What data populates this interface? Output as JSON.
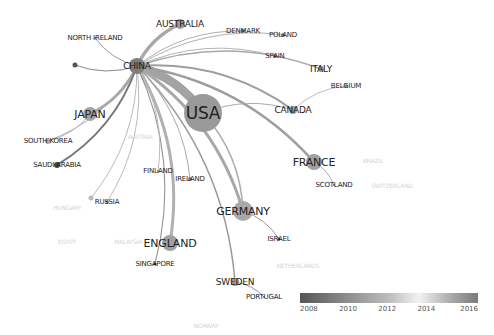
{
  "diagram": {
    "type": "country-collaboration-network",
    "nodes": [
      {
        "id": "usa",
        "label": "USA",
        "x": 203,
        "y": 113,
        "r": 19,
        "size": "xl",
        "shade": "#9a9a9a"
      },
      {
        "id": "china",
        "label": "CHINA",
        "x": 137,
        "y": 66,
        "r": 8,
        "size": "m",
        "shade": "#7d7d7d"
      },
      {
        "id": "australia",
        "label": "AUSTRALIA",
        "x": 180,
        "y": 24,
        "r": 5,
        "size": "m",
        "shade": "#9a9a9a"
      },
      {
        "id": "japan",
        "label": "JAPAN",
        "x": 90,
        "y": 114,
        "r": 7,
        "size": "l",
        "shade": "#a5a5a5"
      },
      {
        "id": "germany",
        "label": "GERMANY",
        "x": 243,
        "y": 211,
        "r": 10,
        "size": "l",
        "shade": "#a8a8a8"
      },
      {
        "id": "england",
        "label": "ENGLAND",
        "x": 170,
        "y": 243,
        "r": 8,
        "size": "l",
        "shade": "#a0a0a0"
      },
      {
        "id": "france",
        "label": "FRANCE",
        "x": 314,
        "y": 162,
        "r": 8,
        "size": "l",
        "shade": "#a0a0a0"
      },
      {
        "id": "canada",
        "label": "CANADA",
        "x": 293,
        "y": 110,
        "r": 4,
        "size": "m",
        "shade": "#9a9a9a"
      },
      {
        "id": "italy",
        "label": "ITALY",
        "x": 321,
        "y": 69,
        "r": 3,
        "size": "m",
        "shade": "#9a9a9a"
      },
      {
        "id": "spain",
        "label": "SPAIN",
        "x": 275,
        "y": 56,
        "r": 2,
        "size": "s",
        "shade": "#777"
      },
      {
        "id": "denmark",
        "label": "DENMARK",
        "x": 243,
        "y": 31,
        "r": 2,
        "size": "s",
        "shade": "#777"
      },
      {
        "id": "poland",
        "label": "POLAND",
        "x": 283,
        "y": 35,
        "r": 2,
        "size": "s",
        "shade": "#777"
      },
      {
        "id": "belgium",
        "label": "BELGIUM",
        "x": 346,
        "y": 86,
        "r": 2,
        "size": "s",
        "shade": "#999"
      },
      {
        "id": "north-ireland",
        "label": "NORTH IRELAND",
        "x": 95,
        "y": 38,
        "r": 1,
        "size": "s",
        "shade": "#777"
      },
      {
        "id": "unlabeled",
        "label": "",
        "x": 75,
        "y": 65,
        "r": 2.5,
        "size": "s",
        "shade": "#555"
      },
      {
        "id": "south-korea",
        "label": "SOUTH KOREA",
        "x": 48,
        "y": 141,
        "r": 3,
        "size": "s",
        "shade": "#aaa"
      },
      {
        "id": "saudi-arabia",
        "label": "SAUDI ARABIA",
        "x": 57,
        "y": 165,
        "r": 3,
        "size": "s",
        "shade": "#444"
      },
      {
        "id": "finland",
        "label": "FINLAND",
        "x": 158,
        "y": 171,
        "r": 1,
        "size": "s",
        "shade": "#777"
      },
      {
        "id": "ireland",
        "label": "IRELAND",
        "x": 190,
        "y": 179,
        "r": 2,
        "size": "s",
        "shade": "#777"
      },
      {
        "id": "russia",
        "label": "RUSSIA",
        "x": 107,
        "y": 202,
        "r": 2,
        "size": "s",
        "shade": "#999"
      },
      {
        "id": "russia-dot",
        "label": "",
        "x": 91,
        "y": 198,
        "r": 2.5,
        "size": "s",
        "shade": "#bbb"
      },
      {
        "id": "singapore",
        "label": "SINGAPORE",
        "x": 155,
        "y": 264,
        "r": 1.5,
        "size": "s",
        "shade": "#333"
      },
      {
        "id": "sweden",
        "label": "SWEDEN",
        "x": 235,
        "y": 282,
        "r": 4,
        "size": "m",
        "shade": "#999"
      },
      {
        "id": "portugal",
        "label": "PORTUGAL",
        "x": 264,
        "y": 297,
        "r": 1,
        "size": "s",
        "shade": "#777"
      },
      {
        "id": "scotland",
        "label": "SCOTLAND",
        "x": 334,
        "y": 185,
        "r": 1,
        "size": "s",
        "shade": "#777"
      },
      {
        "id": "israel",
        "label": "ISRAEL",
        "x": 279,
        "y": 239,
        "r": 1.5,
        "size": "s",
        "shade": "#333"
      },
      {
        "id": "brazil",
        "label": "BRAZIL",
        "x": 373,
        "y": 160,
        "r": 0,
        "size": "faint",
        "shade": "#ddd"
      },
      {
        "id": "switzerland",
        "label": "SWITZERLAND",
        "x": 392,
        "y": 185,
        "r": 0,
        "size": "faint",
        "shade": "#ddd"
      },
      {
        "id": "netherlands",
        "label": "NETHERLANDS",
        "x": 298,
        "y": 265,
        "r": 0,
        "size": "faint",
        "shade": "#ddd"
      },
      {
        "id": "hungary",
        "label": "HUNGARY",
        "x": 67,
        "y": 207,
        "r": 0,
        "size": "faint",
        "shade": "#ddd"
      },
      {
        "id": "egypt",
        "label": "EGYPT",
        "x": 67,
        "y": 241,
        "r": 0,
        "size": "faint",
        "shade": "#ddd"
      },
      {
        "id": "malaysia",
        "label": "MALAYSIA",
        "x": 128,
        "y": 241,
        "r": 0,
        "size": "faint",
        "shade": "#ddd"
      },
      {
        "id": "norway",
        "label": "NORWAY",
        "x": 206,
        "y": 325,
        "r": 0,
        "size": "faint",
        "shade": "#ddd"
      },
      {
        "id": "austria",
        "label": "AUSTRIA",
        "x": 140,
        "y": 136,
        "r": 0,
        "size": "faint",
        "shade": "#ddd"
      }
    ],
    "edges": [
      {
        "from": "china",
        "to": "usa",
        "w": 9,
        "color": "#a3a3a3"
      },
      {
        "from": "china",
        "to": "australia",
        "w": 3.5,
        "color": "#a8a8a8"
      },
      {
        "from": "china",
        "to": "japan",
        "w": 3,
        "color": "#a8a8a8"
      },
      {
        "from": "china",
        "to": "germany",
        "w": 3,
        "color": "#a8a8a8"
      },
      {
        "from": "china",
        "to": "england",
        "w": 3,
        "color": "#b0b0b0"
      },
      {
        "from": "china",
        "to": "france",
        "w": 2.5,
        "color": "#9e9e9e"
      },
      {
        "from": "china",
        "to": "canada",
        "w": 2,
        "color": "#9e9e9e"
      },
      {
        "from": "china",
        "to": "italy",
        "w": 1.5,
        "color": "#a8a8a8"
      },
      {
        "from": "china",
        "to": "denmark",
        "w": 1,
        "color": "#b0b0b0"
      },
      {
        "from": "china",
        "to": "poland",
        "w": 1,
        "color": "#b0b0b0"
      },
      {
        "from": "china",
        "to": "spain",
        "w": 1,
        "color": "#b5b5b5"
      },
      {
        "from": "china",
        "to": "north-ireland",
        "w": 1,
        "color": "#999"
      },
      {
        "from": "china",
        "to": "unlabeled",
        "w": 1,
        "color": "#888"
      },
      {
        "from": "china",
        "to": "saudi-arabia",
        "w": 2,
        "color": "#777"
      },
      {
        "from": "china",
        "to": "south-korea",
        "w": 1,
        "color": "#aaa"
      },
      {
        "from": "china",
        "to": "sweden",
        "w": 1.5,
        "color": "#999"
      },
      {
        "from": "china",
        "to": "singapore",
        "w": 1,
        "color": "#888"
      },
      {
        "from": "china",
        "to": "finland",
        "w": 1,
        "color": "#bbb"
      },
      {
        "from": "china",
        "to": "ireland",
        "w": 1,
        "color": "#aaa"
      },
      {
        "from": "china",
        "to": "russia",
        "w": 1,
        "color": "#bbb"
      },
      {
        "from": "china",
        "to": "russia-dot",
        "w": 1,
        "color": "#bbb"
      },
      {
        "from": "usa",
        "to": "canada",
        "w": 1,
        "color": "#aaa"
      },
      {
        "from": "usa",
        "to": "germany",
        "w": 1.5,
        "color": "#aaa"
      },
      {
        "from": "canada",
        "to": "belgium",
        "w": 1,
        "color": "#bbb"
      },
      {
        "from": "france",
        "to": "scotland",
        "w": 1,
        "color": "#aaa"
      },
      {
        "from": "germany",
        "to": "israel",
        "w": 1,
        "color": "#999"
      },
      {
        "from": "sweden",
        "to": "portugal",
        "w": 1,
        "color": "#999"
      },
      {
        "from": "japan",
        "to": "south-korea",
        "w": 1,
        "color": "#bbb"
      }
    ]
  },
  "legend": {
    "title": "",
    "ticks": [
      {
        "label": "2008",
        "pos": 5
      },
      {
        "label": "2010",
        "pos": 27
      },
      {
        "label": "2012",
        "pos": 49
      },
      {
        "label": "2014",
        "pos": 71
      },
      {
        "label": "2016",
        "pos": 95
      }
    ]
  }
}
